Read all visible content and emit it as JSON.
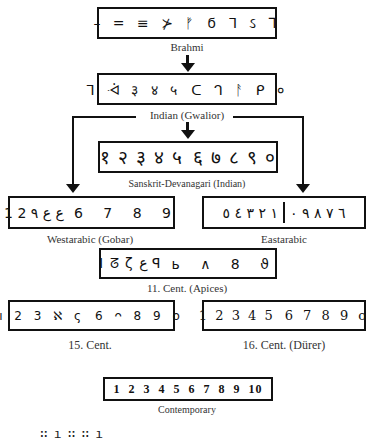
{
  "nodes": {
    "brahmi": {
      "label": "Brahmi",
      "left": "– = ≡ ⊁ ᚠ",
      "right": "ϭ ᒣ ઽ ⅂"
    },
    "indian": {
      "label": "Indian (Gwalior)",
      "left": "ᒣ ᢳ ३ ४ ५",
      "right": "ᑕ ᒉ ᚨ ᑭ ०"
    },
    "sanskrit": {
      "label": "Sanskrit-Devanagari (Indian)",
      "left": "१ २ ३ ४ ५",
      "right": "६ ७ ८ ९ ०"
    },
    "westarabic": {
      "label": "Westarabic (Gobar)",
      "left": "1 2 ع ع ٩",
      "right": "6 7 8 9"
    },
    "eastarabic": {
      "label": "Eastarabic",
      "left": "١ ٢ ٣ ٤ ٥",
      "right": "٦ ٧ ٨ ٩ ٠"
    },
    "apices": {
      "label": "11. Cent. (Apices)",
      "left": "I ᘔ ζ ع ꟼ",
      "right": "ь ∧ 8 ϑ"
    },
    "cent15": {
      "label": "15. Cent.",
      "left": "ı 2 3 ℵ ς",
      "right": "6 ᴖ 8 9 o"
    },
    "cent16": {
      "label": "16. Cent. (Dürer)",
      "left": "1 2 3 4 5",
      "right": "6 7 8 9 o"
    },
    "contemporary": {
      "label": "Contemporary",
      "digits": "1 2 3 4 5 6 7 8 9 10"
    }
  },
  "edges": [
    {
      "from": "brahmi",
      "to": "indian"
    },
    {
      "from": "indian",
      "to": "sanskrit"
    },
    {
      "from": "indian",
      "to": "westarabic"
    },
    {
      "from": "indian",
      "to": "eastarabic"
    }
  ],
  "fragment": "∷ı∷∷ı"
}
